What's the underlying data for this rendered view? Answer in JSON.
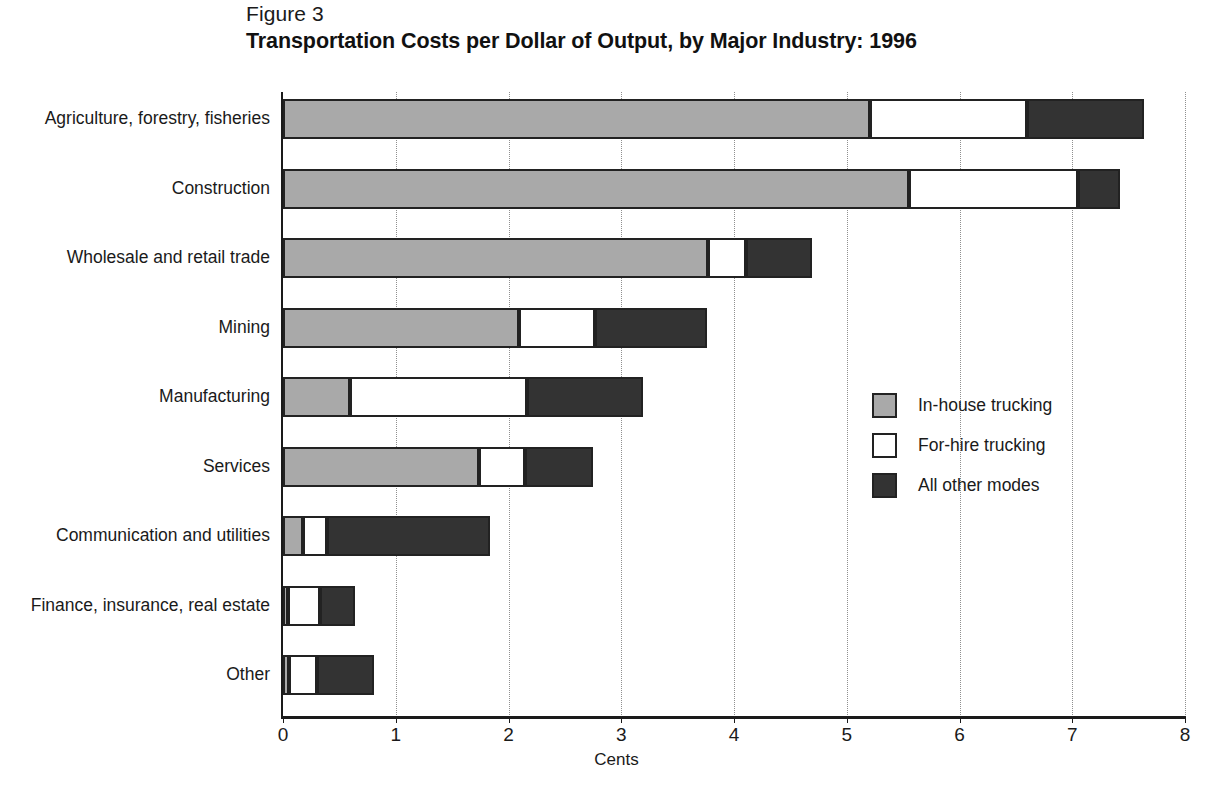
{
  "figure": {
    "label": "Figure 3",
    "title": "Transportation Costs per Dollar of Output, by Major Industry: 1996"
  },
  "chart_data": {
    "type": "bar",
    "orientation": "horizontal",
    "stacked": true,
    "title": "Transportation Costs per Dollar of Output, by Major Industry: 1996",
    "subtitle": "Figure 3",
    "xlabel": "Cents",
    "ylabel": "",
    "xlim": [
      0,
      8
    ],
    "xticks": [
      0,
      1,
      2,
      3,
      4,
      5,
      6,
      7,
      8
    ],
    "xtick_labels": [
      "0",
      "1",
      "2",
      "3",
      "4",
      "5",
      "6",
      "7",
      "8"
    ],
    "grid": "vertical-dotted",
    "legend_position": "middle-right",
    "categories": [
      "Agriculture, forestry, fisheries",
      "Construction",
      "Wholesale and retail trade",
      "Mining",
      "Manufacturing",
      "Services",
      "Communication and utilities",
      "Finance, insurance, real estate",
      "Other"
    ],
    "series": [
      {
        "name": "In-house trucking",
        "color": "#a9a9a9",
        "values": [
          5.21,
          5.55,
          3.77,
          2.09,
          0.59,
          1.74,
          0.18,
          0.04,
          0.05
        ]
      },
      {
        "name": "For-hire trucking",
        "color": "#ffffff",
        "values": [
          1.39,
          1.5,
          0.34,
          0.68,
          1.57,
          0.41,
          0.21,
          0.29,
          0.25
        ]
      },
      {
        "name": "All other modes",
        "color": "#333333",
        "values": [
          1.04,
          0.37,
          0.58,
          0.99,
          1.03,
          0.6,
          1.45,
          0.31,
          0.51
        ]
      }
    ],
    "totals": [
      7.64,
      7.42,
      4.69,
      3.76,
      3.19,
      2.75,
      1.84,
      0.64,
      0.81
    ]
  },
  "legend": {
    "items": [
      {
        "label": "In-house trucking",
        "color": "#a9a9a9"
      },
      {
        "label": "For-hire trucking",
        "color": "#ffffff"
      },
      {
        "label": "All other modes",
        "color": "#333333"
      }
    ]
  }
}
